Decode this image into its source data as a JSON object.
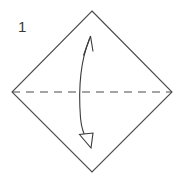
{
  "diagram": {
    "type": "origami-instruction",
    "canvas": {
      "width": 184,
      "height": 177,
      "background": "#ffffff"
    },
    "step": {
      "number": "1",
      "label_position": {
        "x": 18,
        "y": 32
      }
    },
    "shape": {
      "name": "square-rotated-diamond",
      "stroke": "#4a4a4a",
      "stroke_width": 1.1,
      "fill": "none",
      "vertices": [
        {
          "name": "top",
          "x": 92,
          "y": 11
        },
        {
          "name": "right",
          "x": 172,
          "y": 92
        },
        {
          "name": "bottom",
          "x": 92,
          "y": 172
        },
        {
          "name": "left",
          "x": 12,
          "y": 92
        }
      ]
    },
    "fold_line": {
      "name": "horizontal-valley-fold",
      "style": "dashed",
      "stroke": "#4a4a4a",
      "stroke_width": 1.1,
      "dash_pattern": "8 6",
      "from": {
        "x": 12,
        "y": 92
      },
      "to": {
        "x": 172,
        "y": 92
      }
    },
    "arrow": {
      "name": "fold-and-unfold-arrow",
      "style": "double-headed-curved",
      "stroke": "#3a3a3a",
      "stroke_width": 1.1,
      "path": "M 89.5 39 C 80 62, 78.5 92, 80.5 118 C 81.5 129, 84.5 136, 87.5 140.5",
      "head_top": {
        "name": "open-v-arrowhead",
        "tip": {
          "x": 90.5,
          "y": 36
        },
        "points": "83.5,55.5 90.5,36 93,51.5"
      },
      "head_bottom": {
        "name": "open-triangle-arrowhead",
        "tip": {
          "x": 91,
          "y": 148
        },
        "points": "79.5,134.5 91,148 93,133"
      }
    }
  }
}
